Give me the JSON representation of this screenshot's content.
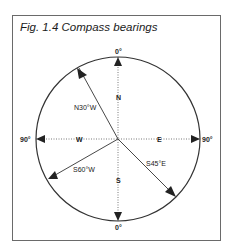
{
  "figure": {
    "title": "Fig. 1.4  Compass bearings"
  },
  "compass": {
    "cardinal_labels": {
      "north": "N",
      "south": "S",
      "east": "E",
      "west": "W"
    },
    "angle_labels": {
      "top": "0°",
      "bottom": "0°",
      "left": "90°",
      "right": "90°"
    },
    "bearings": [
      {
        "label": "N30°W",
        "direction": "north-west",
        "angle_from_north": -30
      },
      {
        "label": "S45°E",
        "direction": "south-east",
        "angle_from_south": 45
      },
      {
        "label": "S60°W",
        "direction": "south-west",
        "angle_from_south": -60
      }
    ]
  }
}
